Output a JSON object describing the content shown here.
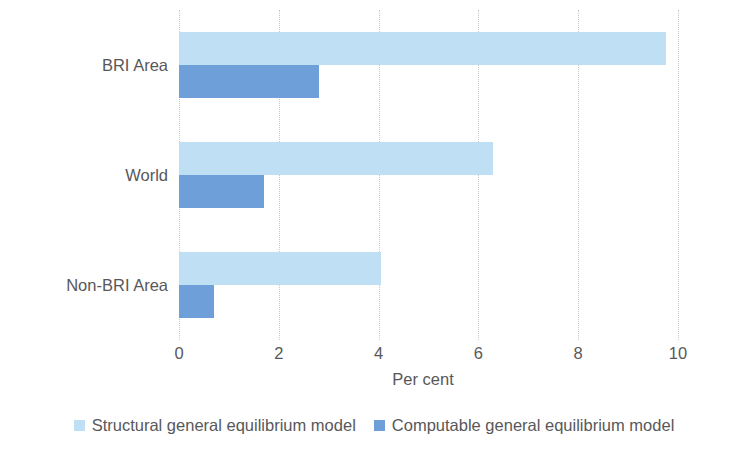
{
  "chart_data": {
    "type": "bar",
    "orientation": "horizontal",
    "title": "",
    "subtitle": "",
    "xlabel": "Per cent",
    "ylabel": "",
    "categories": [
      "BRI Area",
      "World",
      "Non-BRI Area"
    ],
    "series": [
      {
        "name": "Structural general equilibrium model",
        "color": "#bfdff5",
        "values": [
          9.75,
          6.3,
          4.05
        ]
      },
      {
        "name": "Computable general equilibrium model",
        "color": "#6f9fd8",
        "values": [
          2.8,
          1.7,
          0.7
        ]
      }
    ],
    "xlim": [
      0,
      10
    ],
    "xticks": [
      0,
      2,
      4,
      6,
      8,
      10
    ],
    "xtick_labels": [
      "0",
      "2",
      "4",
      "6",
      "8",
      "10"
    ],
    "grid": {
      "vertical": true,
      "horizontal": false,
      "style": "dotted",
      "color": "#c9c9c9"
    },
    "legend": {
      "position": "bottom",
      "orientation": "horizontal",
      "entries": [
        {
          "label": "Structural general equilibrium model",
          "color": "#bfdff5"
        },
        {
          "label": "Computable general equilibrium model",
          "color": "#6f9fd8"
        }
      ]
    },
    "axis_text_color": "#58585a",
    "background_color": "#ffffff"
  }
}
